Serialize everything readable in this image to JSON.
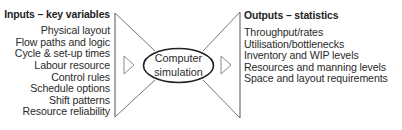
{
  "inputs": {
    "heading": "Inputs – key variables",
    "items": [
      "Physical layout",
      "Flow paths and logic",
      "Cycle & set-up times",
      "Labour resource",
      "Control rules",
      "Schedule options",
      "Shift patterns",
      "Resource reliability"
    ]
  },
  "center": {
    "line1": "Computer",
    "line2": "simulation"
  },
  "outputs": {
    "heading": "Outputs – statistics",
    "items": [
      "Throughput/rates",
      "Utilisation/bottlenecks",
      "Inventory and WIP levels",
      "Resources and manning levels",
      "Space and layout requirements"
    ]
  },
  "colors": {
    "line": "#555555",
    "triangle": "#8a8a8a",
    "ellipse": "#222222",
    "text": "#2a2a2a"
  }
}
